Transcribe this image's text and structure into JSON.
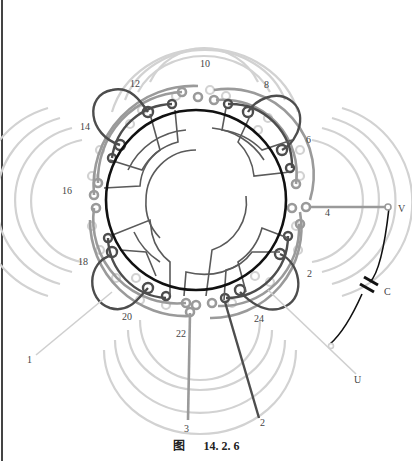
{
  "figure": {
    "caption_prefix": "图",
    "caption_number": "14. 2. 6"
  },
  "diagram": {
    "center": [
      196,
      200
    ],
    "stator_radius": 90,
    "colors": {
      "stator": "#111111",
      "dark": "#4a4a4a",
      "mid": "#8f8f8f",
      "light": "#cfcfcf",
      "capacitor": "#111111"
    },
    "coil_labels": [
      {
        "text": "10",
        "x": 200,
        "y": 67
      },
      {
        "text": "8",
        "x": 264,
        "y": 88
      },
      {
        "text": "12",
        "x": 130,
        "y": 87
      },
      {
        "text": "6",
        "x": 306,
        "y": 143
      },
      {
        "text": "14",
        "x": 80,
        "y": 130
      },
      {
        "text": "16",
        "x": 62,
        "y": 194
      },
      {
        "text": "4",
        "x": 325,
        "y": 216
      },
      {
        "text": "18",
        "x": 78,
        "y": 265
      },
      {
        "text": "2",
        "x": 307,
        "y": 277
      },
      {
        "text": "20",
        "x": 122,
        "y": 320
      },
      {
        "text": "24",
        "x": 254,
        "y": 322
      },
      {
        "text": "22",
        "x": 176,
        "y": 337
      }
    ],
    "lead_labels": [
      {
        "text": "V",
        "x": 400,
        "y": 212
      },
      {
        "text": "C",
        "x": 385,
        "y": 292
      },
      {
        "text": "U",
        "x": 356,
        "y": 381
      },
      {
        "text": "1",
        "x": 30,
        "y": 361
      },
      {
        "text": "3",
        "x": 183,
        "y": 431
      },
      {
        "text": "2",
        "x": 262,
        "y": 425
      }
    ],
    "component": {
      "type": "capacitor",
      "label": "C"
    }
  }
}
